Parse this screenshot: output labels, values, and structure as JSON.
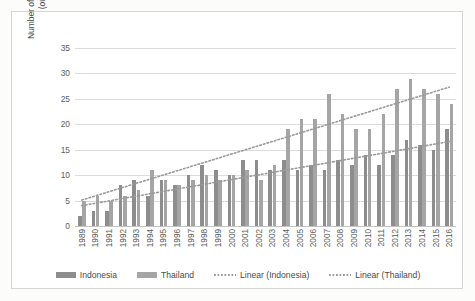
{
  "chart_data": {
    "type": "bar",
    "title": "",
    "xlabel": "",
    "ylabel": "Number of items whose RCA|>1\n(out of 57 items)",
    "ylim": [
      0,
      35
    ],
    "yticks": [
      0,
      5,
      10,
      15,
      20,
      25,
      30,
      35
    ],
    "grid": true,
    "legend_position": "bottom",
    "categories": [
      "1989",
      "1990",
      "1991",
      "1992",
      "1993",
      "1994",
      "1995",
      "1996",
      "1997",
      "1998",
      "1999",
      "2000",
      "2001",
      "2002",
      "2003",
      "2004",
      "2005",
      "2006",
      "2007",
      "2008",
      "2009",
      "2010",
      "2011",
      "2012",
      "2013",
      "2014",
      "2015",
      "2016"
    ],
    "series": [
      {
        "name": "Indonesia",
        "color": "#8d8d8d",
        "values": [
          2,
          3,
          3,
          8,
          9,
          6,
          9,
          8,
          10,
          12,
          11,
          10,
          13,
          13,
          11,
          13,
          11,
          12,
          11,
          13,
          12,
          14,
          12,
          14,
          17,
          16,
          15,
          19
        ]
      },
      {
        "name": "Thailand",
        "color": "#a5a5a5",
        "values": [
          5,
          6,
          5,
          6,
          7,
          11,
          9,
          8,
          9,
          10,
          9,
          10,
          11,
          9,
          12,
          19,
          21,
          21,
          26,
          22,
          19,
          19,
          22,
          27,
          29,
          27,
          26,
          24
        ]
      }
    ],
    "trendlines": [
      {
        "name": "Linear (Indonesia)",
        "for_series": "Indonesia",
        "color": "#9a9a9a",
        "style": "dotted",
        "start_value": 4.0,
        "end_value": 16.6
      },
      {
        "name": "Linear (Thailand)",
        "for_series": "Thailand",
        "color": "#9a9a9a",
        "style": "dotted",
        "start_value": 5.1,
        "end_value": 27.3
      }
    ],
    "legend": [
      "Indonesia",
      "Thailand",
      "Linear (Indonesia)",
      "Linear (Thailand)"
    ]
  }
}
